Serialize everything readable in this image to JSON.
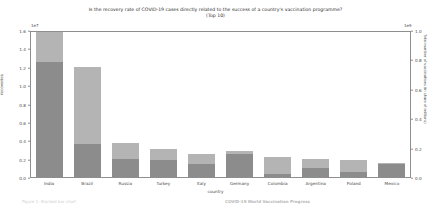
{
  "chart_data": {
    "type": "bar",
    "stacked": true,
    "title": "Is the recovery rate of COVID-19 cases directly related to the success of a country's vaccination programme?",
    "subtitle": "(Top 10)",
    "xlabel": "country",
    "ylabel": "recoveries",
    "y2label": "Total number of vaccinations (in share of millions)",
    "y_exponent_label": "1e7",
    "y2_exponent_label": "1e9",
    "ylim": [
      0.0,
      1.6
    ],
    "y2lim": [
      0.0,
      1.0
    ],
    "yticks": [
      "0.0",
      "0.2",
      "0.4",
      "0.6",
      "0.8",
      "1.0",
      "1.2",
      "1.4",
      "1.6"
    ],
    "y2ticks": [
      "0.0",
      "0.2",
      "0.4",
      "0.6",
      "0.8",
      "1.0"
    ],
    "grid": false,
    "legend": "none",
    "categories": [
      "India",
      "Brazil",
      "Russia",
      "Turkey",
      "Italy",
      "Germany",
      "Colombia",
      "Argentina",
      "Poland",
      "Mexico"
    ],
    "series": [
      {
        "name": "recoveries",
        "unit": "1e7",
        "color": "#8c8c8c",
        "values": [
          1.25,
          0.36,
          0.2,
          0.18,
          0.14,
          0.25,
          0.03,
          0.1,
          0.06,
          0.14
        ]
      },
      {
        "name": "vaccinations",
        "unit": "1e9",
        "color": "#b4b4b4",
        "values": [
          0.205,
          0.54,
          0.115,
          0.085,
          0.085,
          0.02,
          0.12,
          0.07,
          0.1,
          0.015
        ]
      }
    ],
    "bar_totals_1e7": [
      1.58,
      1.2,
      0.37,
      0.3,
      0.25,
      0.28,
      0.22,
      0.2,
      0.185,
      0.15
    ]
  },
  "footer": {
    "left_text": "Figure 1: Stacked bar chart",
    "right_text": "COVID-19 World Vaccination Progress"
  }
}
